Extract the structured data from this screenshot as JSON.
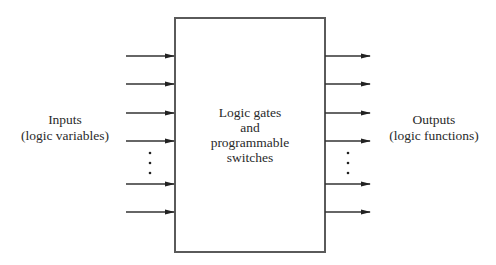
{
  "diagram": {
    "type": "block-diagram",
    "block": {
      "lines": [
        "Logic gates",
        "and",
        "programmable",
        "switches"
      ],
      "x": 175,
      "y": 18,
      "width": 150,
      "height": 234,
      "stroke": "#555555"
    },
    "inputs": {
      "label_lines": [
        "Inputs",
        "(logic variables)"
      ],
      "arrow_y": [
        56,
        84,
        113,
        141,
        184,
        212
      ],
      "ellipsis_dots_y": [
        153,
        163,
        173
      ]
    },
    "outputs": {
      "label_lines": [
        "Outputs",
        "(logic functions)"
      ],
      "arrow_y": [
        56,
        84,
        113,
        141,
        184,
        212
      ],
      "ellipsis_dots_y": [
        153,
        163,
        173
      ]
    },
    "colors": {
      "line": "#333333",
      "box": "#555555",
      "text": "#2a2a2a"
    }
  }
}
